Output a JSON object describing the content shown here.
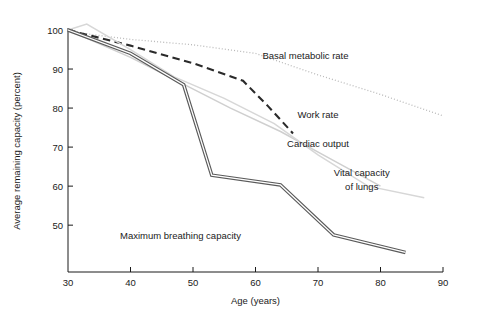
{
  "chart_data": {
    "type": "line",
    "title": "",
    "xlabel": "Age (years)",
    "ylabel": "Average remaining capacity (percent)",
    "xlim": [
      30,
      90
    ],
    "ylim": [
      38,
      100
    ],
    "xticks": [
      30,
      40,
      50,
      60,
      70,
      80,
      90
    ],
    "yticks": [
      50,
      60,
      70,
      80,
      90,
      100
    ],
    "grid": false,
    "legend_position": "inline-annotations",
    "series": [
      {
        "name": "Basal metabolic rate",
        "style": "dotted",
        "color": "#b9b9b9",
        "label_x": 68,
        "label_y": 92.5,
        "x": [
          30,
          33,
          40,
          50,
          60,
          70,
          80,
          90
        ],
        "y": [
          100,
          99.0,
          97.6,
          96.2,
          94.0,
          88.5,
          83.5,
          78.0
        ]
      },
      {
        "name": "Work rate",
        "style": "dashed",
        "color": "#2a2a2a",
        "label_x": 70,
        "label_y": 77.5,
        "x": [
          30,
          40,
          50,
          58,
          62,
          66
        ],
        "y": [
          100,
          96.0,
          91.5,
          87.0,
          80.5,
          73.5
        ]
      },
      {
        "name": "Cardiac output",
        "style": "solid",
        "color": "#cfcfcf",
        "label_x": 70,
        "label_y": 70.0,
        "x": [
          30,
          40,
          48,
          56,
          64,
          72,
          80
        ],
        "y": [
          100,
          93.0,
          86.5,
          80.0,
          74.0,
          67.0,
          60.0
        ]
      },
      {
        "name": "Vital capacity of lungs",
        "style": "solid",
        "color": "#d7d7d7",
        "label_x": 77,
        "label_y": 62.0,
        "x": [
          30,
          33,
          40,
          47,
          55,
          63,
          70,
          78,
          87
        ],
        "y": [
          100,
          101.5,
          95.0,
          88.0,
          82.5,
          76.0,
          68.0,
          60.0,
          57.0
        ]
      },
      {
        "name": "Maximum breathing capacity",
        "style": "double",
        "color": "#5a5a5a",
        "label_x": 48,
        "label_y": 46.5,
        "x": [
          30,
          40,
          48.5,
          53,
          64,
          72.5,
          84
        ],
        "y": [
          100,
          94.0,
          86.0,
          62.8,
          60.3,
          47.5,
          43.0
        ]
      }
    ],
    "annotations": [
      {
        "text": "Basal metabolic rate",
        "x": 68,
        "y": 92.5
      },
      {
        "text": "Work rate",
        "x": 70,
        "y": 77.5
      },
      {
        "text": "Cardiac output",
        "x": 70,
        "y": 70.0
      },
      {
        "text": "Vital capacity",
        "x": 77,
        "y": 62.5
      },
      {
        "text": "of lungs",
        "x": 77,
        "y": 59.0
      },
      {
        "text": "Maximum breathing capacity",
        "x": 48,
        "y": 46.5
      }
    ]
  }
}
